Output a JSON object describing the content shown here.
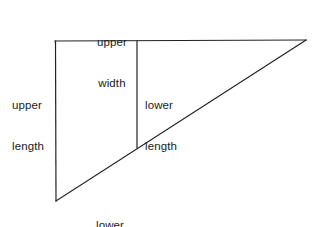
{
  "figure": {
    "type": "geometry-diagram",
    "background_color": "#ffffff",
    "line_color": "#222222",
    "text_color": "#1b1b1b",
    "width": 314,
    "height": 227,
    "shape": "right-triangle-with-vertical-divider"
  },
  "labels": {
    "upper_width": {
      "line1": "upper",
      "line2": "width"
    },
    "upper_length": {
      "line1": "upper",
      "line2": "length"
    },
    "lower_length": {
      "line1": "lower",
      "line2": "length"
    },
    "lower_width": {
      "line1": "lower",
      "line2": "width"
    }
  },
  "geometry": {
    "vertices": {
      "top_left": [
        55,
        41
      ],
      "top_right": [
        306,
        40
      ],
      "bottom_left": [
        56,
        201
      ]
    },
    "divider": {
      "x": 137,
      "y_top": 41,
      "y_bottom": 148
    },
    "stroke_width": 1.2
  }
}
